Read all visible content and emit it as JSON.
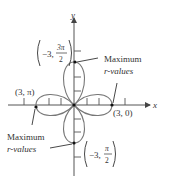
{
  "diagram": {
    "type": "polar-rose-curve",
    "axes": {
      "x_label": "x",
      "y_label": "y"
    },
    "points": [
      {
        "id": "top",
        "label_main": "−3,",
        "label_frac_num": "3π",
        "label_frac_den": "2"
      },
      {
        "id": "left",
        "label": "(3, π)"
      },
      {
        "id": "right",
        "label": "(3, 0)"
      },
      {
        "id": "bottom",
        "label_main": "−3,",
        "label_frac_num": "π",
        "label_frac_den": "2"
      }
    ],
    "annotations": [
      {
        "id": "upper-right",
        "line1": "Maximum",
        "line2": "r-values"
      },
      {
        "id": "lower-left",
        "line1": "Maximum",
        "line2": "r-values"
      }
    ],
    "colors": {
      "curve": "#777777",
      "axis": "#555555",
      "text": "#333333",
      "dot": "#111111"
    }
  }
}
